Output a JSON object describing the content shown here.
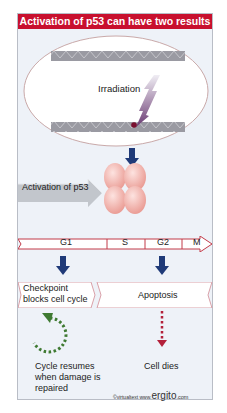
{
  "title": "Activation of p53 can have two results",
  "cell": {
    "stimulus_label": "Irradiation"
  },
  "activation": {
    "label": "Activation of p53"
  },
  "cell_cycle": {
    "phases": [
      "G1",
      "S",
      "G2",
      "M"
    ]
  },
  "outcomes": {
    "left": {
      "box_line1": "Checkpoint",
      "box_line2": "blocks cell cycle",
      "result_line1": "Cycle resumes",
      "result_line2": "when damage is",
      "result_line3": "repaired"
    },
    "right": {
      "box_label": "Apoptosis",
      "result_label": "Cell dies"
    }
  },
  "credit": {
    "prefix": "©virtualtext",
    "www": "www.",
    "brand": "ergito",
    "suffix": ".com"
  },
  "colors": {
    "title_bg": "#c8102e",
    "frame_bg": "#eef2f8",
    "arrow_blue": "#1f3a78",
    "dna_gray": "#9a9aa2",
    "p53_pink": "#f4b3ae",
    "cycle_red": "#c23a48",
    "resume_green": "#3f7a32",
    "death_red": "#b3203a"
  }
}
